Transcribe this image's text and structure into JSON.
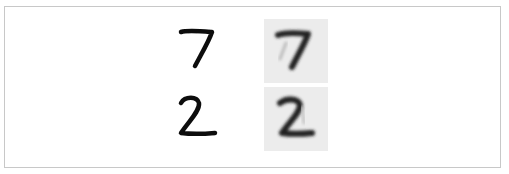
{
  "figure": {
    "rows": [
      {
        "digit": "7",
        "original_label": "7",
        "reconstruction_label": "7"
      },
      {
        "digit": "2",
        "original_label": "2",
        "reconstruction_label": "2"
      }
    ],
    "colors": {
      "border": "#c8c8c8",
      "ink": "#111111",
      "reconstruction_background": "#ececec"
    }
  }
}
